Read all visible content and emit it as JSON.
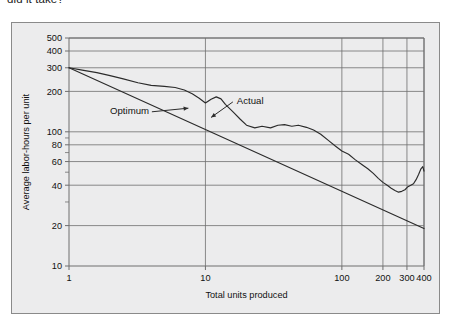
{
  "page": {
    "clipped_text_above_figure": "did it take?"
  },
  "figure": {
    "background_color": "#ececed",
    "border_color": "#8a8a8a",
    "line_color": "#2b2b2b",
    "grid_color": "#6e6e6e"
  },
  "chart_data": {
    "type": "line",
    "title": "",
    "xlabel": "Total units produced",
    "ylabel": "Average labor-hours per unit",
    "xscale": "log",
    "yscale": "log",
    "xlim": [
      1,
      400
    ],
    "ylim": [
      10,
      500
    ],
    "grid": true,
    "legend": "inline-annotations",
    "x_major_ticks": [
      1,
      10,
      100,
      200,
      300,
      400
    ],
    "x_tick_labels": [
      "1",
      "10",
      "100",
      "200",
      "300",
      "400"
    ],
    "y_major_ticks": [
      10,
      20,
      40,
      60,
      80,
      100,
      200,
      300,
      400,
      500
    ],
    "y_tick_labels": [
      "10",
      "20",
      "40",
      "60",
      "80",
      "100",
      "200",
      "300",
      "400",
      "500"
    ],
    "y_minor_ticks": [
      30,
      50,
      70,
      90
    ],
    "annotations": [
      {
        "label": "Optimum",
        "text_x": 2.0,
        "text_y": 135,
        "points_to_x": 7.5,
        "points_to_y": 150
      },
      {
        "label": "Actual",
        "text_x": 17.0,
        "text_y": 160,
        "points_to_x": 11.0,
        "points_to_y": 128
      }
    ],
    "series": [
      {
        "name": "Optimum",
        "style": "straight-line",
        "x": [
          1,
          400
        ],
        "values": [
          300,
          19
        ]
      },
      {
        "name": "Actual",
        "style": "jagged-line",
        "x": [
          1,
          1.25,
          1.6,
          2.0,
          2.5,
          3.2,
          4.0,
          5.0,
          6.0,
          7.0,
          8.0,
          9.0,
          10.0,
          11.0,
          12.0,
          13.0,
          14.0,
          16.0,
          18.0,
          20.0,
          23.0,
          26.0,
          30.0,
          34.0,
          38.0,
          43.0,
          48.0,
          55.0,
          62.0,
          70.0,
          80.0,
          90.0,
          100.0,
          112.0,
          125.0,
          140.0,
          155.0,
          170.0,
          185.0,
          200.0,
          215.0,
          230.0,
          245.0,
          260.0,
          275.0,
          290.0,
          305.0,
          320.0,
          335.0,
          350.0,
          365.0,
          380.0,
          392.0,
          400.0
        ],
        "values": [
          300,
          288,
          276,
          262,
          248,
          232,
          222,
          218,
          214,
          205,
          192,
          178,
          164,
          175,
          182,
          176,
          160,
          140,
          124,
          112,
          107,
          110,
          107,
          112,
          113,
          110,
          112,
          108,
          103,
          96,
          86,
          78,
          72,
          68,
          62,
          57,
          53,
          49,
          45,
          42,
          40,
          38,
          36.5,
          35.5,
          36,
          37,
          39,
          40,
          41,
          44,
          48,
          53,
          55,
          51
        ]
      }
    ]
  }
}
